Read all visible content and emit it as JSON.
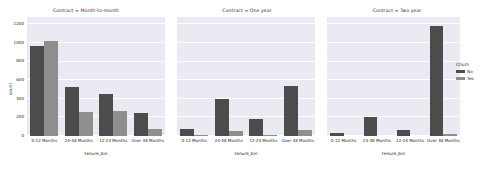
{
  "chart_data": {
    "type": "bar",
    "title": "",
    "xlabel": "tenure_bin",
    "ylabel": "count",
    "ylim": [
      0,
      1280
    ],
    "yticks": [
      0,
      200,
      400,
      600,
      800,
      1000,
      1200
    ],
    "ytick_labels": [
      "0",
      "200",
      "400",
      "600",
      "800",
      "1000",
      "1200"
    ],
    "grid": true,
    "grid_axis": "y",
    "legend": {
      "title": "Churn",
      "position": "right",
      "entries": [
        {
          "label": "No",
          "color": "#4c4c4c"
        },
        {
          "label": "Yes",
          "color": "#8e8e8e"
        }
      ]
    },
    "categories": [
      "0-12 Months",
      "24-48 Months",
      "12-24 Months",
      "Over 48 Months"
    ],
    "facet_variable": "Contract",
    "facets": [
      {
        "title": "Contract = Month-to-month",
        "series": [
          {
            "name": "No",
            "values": [
              965,
              530,
              450,
              250
            ]
          },
          {
            "name": "Yes",
            "values": [
              1020,
              255,
              270,
              80
            ]
          }
        ]
      },
      {
        "title": "Contract = One year",
        "series": [
          {
            "name": "No",
            "values": [
              75,
              395,
              185,
              540
            ]
          },
          {
            "name": "Yes",
            "values": [
              8,
              55,
              6,
              60
            ]
          }
        ]
      },
      {
        "title": "Contract = Two year",
        "series": [
          {
            "name": "No",
            "values": [
              30,
              205,
              70,
              1180
            ]
          },
          {
            "name": "Yes",
            "values": [
              0,
              0,
              0,
              18
            ]
          }
        ]
      }
    ]
  }
}
